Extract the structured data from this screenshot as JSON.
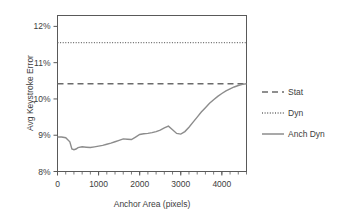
{
  "chart_data": {
    "type": "line",
    "title": "",
    "xlabel": "Anchor Area (pixels)",
    "ylabel": "Avg Keystroke Error",
    "xlim": [
      0,
      4600
    ],
    "ylim": [
      8,
      12.3
    ],
    "xticks": [
      0,
      1000,
      2000,
      3000,
      4000
    ],
    "xticklabels": [
      "0",
      "1000",
      "2000",
      "3000",
      "4000"
    ],
    "yticks": [
      8,
      9,
      10,
      11,
      12
    ],
    "yticklabels": [
      "8%",
      "9%",
      "10%",
      "11%",
      "12%"
    ],
    "x_minor_tick_interval": 200,
    "grid": false,
    "legend_position": "right",
    "y_unit": "percent",
    "series": [
      {
        "name": "Stat",
        "style": "dashed",
        "type": "constant",
        "value": 10.42,
        "color": "#6b6b6b",
        "x": [
          0,
          4600
        ],
        "values": [
          10.42,
          10.42
        ]
      },
      {
        "name": "Dyn",
        "style": "dotted",
        "type": "constant",
        "value": 11.55,
        "color": "#6b6b6b",
        "x": [
          0,
          4600
        ],
        "values": [
          11.55,
          11.55
        ]
      },
      {
        "name": "Anch Dyn",
        "style": "solid",
        "type": "curve",
        "color": "#8c8c8c",
        "x": [
          0,
          100,
          200,
          300,
          350,
          400,
          450,
          500,
          600,
          700,
          800,
          900,
          1000,
          1100,
          1200,
          1300,
          1400,
          1500,
          1600,
          1700,
          1800,
          1900,
          2000,
          2100,
          2200,
          2300,
          2400,
          2500,
          2600,
          2700,
          2800,
          2900,
          3000,
          3100,
          3200,
          3300,
          3400,
          3500,
          3600,
          3700,
          3800,
          3900,
          4000,
          4100,
          4200,
          4300,
          4400,
          4500,
          4600
        ],
        "values": [
          8.95,
          8.95,
          8.93,
          8.82,
          8.62,
          8.6,
          8.62,
          8.66,
          8.68,
          8.67,
          8.66,
          8.68,
          8.7,
          8.72,
          8.75,
          8.78,
          8.82,
          8.86,
          8.9,
          8.89,
          8.88,
          8.95,
          9.02,
          9.04,
          9.05,
          9.07,
          9.1,
          9.14,
          9.2,
          9.25,
          9.15,
          9.05,
          9.03,
          9.1,
          9.22,
          9.36,
          9.5,
          9.64,
          9.76,
          9.88,
          9.98,
          10.07,
          10.15,
          10.22,
          10.28,
          10.33,
          10.37,
          10.4,
          10.42
        ]
      }
    ]
  },
  "legend": {
    "items": [
      {
        "label": "Stat",
        "style": "dashed"
      },
      {
        "label": "Dyn",
        "style": "dotted"
      },
      {
        "label": "Anch Dyn",
        "style": "solid"
      }
    ]
  },
  "colors": {
    "axis": "#595959",
    "text": "#3d3d3d",
    "background": "#ffffff",
    "series_solid": "#8c8c8c",
    "series_ref": "#6b6b6b"
  }
}
